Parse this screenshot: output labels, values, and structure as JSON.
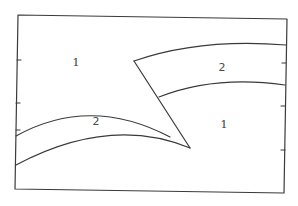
{
  "diagram": {
    "colors": {
      "stroke": "#3a3a3a",
      "background": "#ffffff"
    },
    "frame": {
      "corners": {
        "top_left": [
          18,
          15
        ],
        "top_right": [
          287,
          19
        ],
        "bottom_right": [
          284,
          193
        ],
        "bottom_left": [
          15,
          189
        ]
      },
      "left_ticks_y": [
        60,
        103,
        130
      ],
      "right_ticks_y": [
        63,
        106,
        150
      ]
    },
    "regions": [
      {
        "label": "1",
        "position": [
          76,
          66
        ]
      },
      {
        "label": "2",
        "position": [
          222,
          71
        ]
      },
      {
        "label": "2",
        "position": [
          96,
          125
        ]
      },
      {
        "label": "1",
        "position": [
          224,
          128
        ]
      }
    ],
    "bands": [
      {
        "name": "upper-right-band",
        "top_curve": "M134,61 Q200,38 286,45",
        "bottom_curve": "M159,97 Q215,75 285,85"
      },
      {
        "name": "lower-left-band",
        "top_curve": "M16,136 Q90,95 170,137",
        "bottom_curve": "M16,165 Q110,115 190,148"
      }
    ],
    "fault_line": {
      "from": [
        134,
        61
      ],
      "to": [
        190,
        148
      ]
    }
  }
}
